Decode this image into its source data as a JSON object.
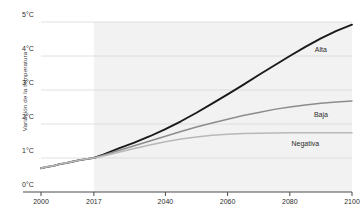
{
  "chart_data": {
    "type": "line",
    "title": "",
    "subtitle": "",
    "xlabel": "",
    "ylabel": "Variación de la temperatura",
    "xlim": [
      2000,
      2100
    ],
    "ylim": [
      0,
      5
    ],
    "grid": true,
    "legend_position": "right-inline",
    "y_ticks": [
      "0°C",
      "1°C",
      "2°C",
      "3°C",
      "4°C",
      "5°C"
    ],
    "y_tick_values": [
      0,
      1,
      2,
      3,
      4,
      5
    ],
    "x_ticks": [
      "2000",
      "2017",
      "2040",
      "2060",
      "2080",
      "2100"
    ],
    "x_tick_values": [
      2000,
      2017,
      2040,
      2060,
      2080,
      2100
    ],
    "projection_start_year": 2017,
    "projection_shading": "#f2f2f2",
    "series": [
      {
        "name": "Alta",
        "color": "#1a1a1a",
        "x": [
          2000,
          2002,
          2004,
          2006,
          2008,
          2010,
          2012,
          2014,
          2016,
          2017,
          2020,
          2025,
          2030,
          2035,
          2040,
          2045,
          2050,
          2055,
          2060,
          2065,
          2070,
          2075,
          2080,
          2085,
          2090,
          2095,
          2100
        ],
        "values": [
          0.7,
          0.74,
          0.77,
          0.82,
          0.85,
          0.89,
          0.93,
          0.96,
          0.99,
          1.0,
          1.1,
          1.28,
          1.45,
          1.64,
          1.85,
          2.08,
          2.33,
          2.6,
          2.87,
          3.15,
          3.44,
          3.72,
          4.0,
          4.27,
          4.52,
          4.74,
          4.92
        ]
      },
      {
        "name": "Baja",
        "color": "#8c8c8c",
        "x": [
          2000,
          2002,
          2004,
          2006,
          2008,
          2010,
          2012,
          2014,
          2016,
          2017,
          2020,
          2025,
          2030,
          2035,
          2040,
          2045,
          2050,
          2055,
          2060,
          2065,
          2070,
          2075,
          2080,
          2085,
          2090,
          2095,
          2100
        ],
        "values": [
          0.7,
          0.74,
          0.77,
          0.82,
          0.85,
          0.89,
          0.93,
          0.96,
          0.99,
          1.0,
          1.08,
          1.22,
          1.36,
          1.5,
          1.64,
          1.78,
          1.91,
          2.03,
          2.14,
          2.25,
          2.34,
          2.43,
          2.5,
          2.56,
          2.61,
          2.65,
          2.68
        ]
      },
      {
        "name": "Negativa",
        "color": "#b8b8b8",
        "x": [
          2000,
          2002,
          2004,
          2006,
          2008,
          2010,
          2012,
          2014,
          2016,
          2017,
          2020,
          2025,
          2030,
          2035,
          2040,
          2045,
          2050,
          2055,
          2060,
          2065,
          2070,
          2075,
          2080,
          2085,
          2090,
          2095,
          2100
        ],
        "values": [
          0.7,
          0.74,
          0.77,
          0.82,
          0.85,
          0.89,
          0.93,
          0.96,
          0.99,
          1.0,
          1.06,
          1.17,
          1.28,
          1.38,
          1.48,
          1.56,
          1.62,
          1.67,
          1.7,
          1.72,
          1.73,
          1.735,
          1.74,
          1.74,
          1.74,
          1.74,
          1.74
        ]
      }
    ],
    "annotations": [
      {
        "text": "Alta",
        "x": 2090,
        "y": 4.15
      },
      {
        "text": "Baja",
        "x": 2090,
        "y": 2.25
      },
      {
        "text": "Negativa",
        "x": 2085,
        "y": 1.38
      }
    ]
  }
}
